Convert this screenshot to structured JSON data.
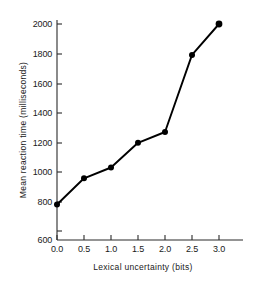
{
  "chart_data": {
    "type": "line",
    "title": "",
    "xlabel": "Lexical  uncertainty  (bits)",
    "ylabel": "Mean  reaction  time  (milliseconds)",
    "x": [
      0.0,
      0.5,
      1.0,
      1.5,
      2.0,
      2.5,
      3.0
    ],
    "values": [
      830,
      1000,
      1070,
      1230,
      1300,
      1800,
      2000
    ],
    "series": [
      {
        "name": "Mean reaction time",
        "values": [
          830,
          1000,
          1070,
          1230,
          1300,
          1800,
          2000
        ]
      }
    ],
    "xlim": [
      0.0,
      3.25
    ],
    "ylim": [
      600,
      2000
    ],
    "xticks": [
      0.0,
      0.5,
      1.0,
      1.5,
      2.0,
      2.5,
      3.0
    ],
    "xticklabels": [
      "0.0",
      "0.5",
      "1.0",
      "1.5",
      "2.0",
      "2.5",
      "3.0"
    ],
    "yticks": [
      600,
      800,
      1000,
      1200,
      1400,
      1600,
      1800,
      2000
    ],
    "yticklabels": [
      "600",
      "800",
      "1000",
      "1200",
      "1400",
      "1600",
      "1800",
      "2000"
    ],
    "grid": false,
    "legend": "none",
    "marker": "filled-circle",
    "line_color": "#000000",
    "marker_color": "#000000",
    "axis_color": "#2b2b2b",
    "background_color": "#ffffff"
  },
  "axes": {
    "x_tick_labels": [
      {
        "label": "0.0"
      },
      {
        "label": "0.5"
      },
      {
        "label": "1.0"
      },
      {
        "label": "1.5"
      },
      {
        "label": "2.0"
      },
      {
        "label": "2.5"
      },
      {
        "label": "3.0"
      }
    ],
    "y_tick_labels": [
      {
        "label": "2000"
      },
      {
        "label": "1800"
      },
      {
        "label": "1600"
      },
      {
        "label": "1400"
      },
      {
        "label": "1200"
      },
      {
        "label": "1000"
      },
      {
        "label": "800"
      },
      {
        "label": "600"
      }
    ],
    "x_axis_title": "Lexical  uncertainty  (bits)",
    "y_axis_title": "Mean  reaction  time  (milliseconds)"
  }
}
